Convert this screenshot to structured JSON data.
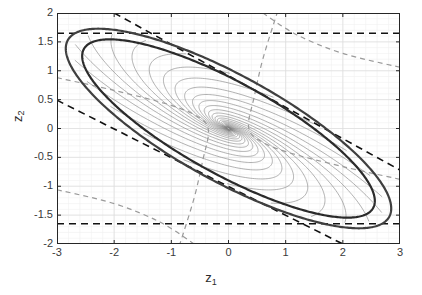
{
  "figure": {
    "background": "#ffffff",
    "axis_color": "#262626",
    "grid_color": "#e6e6e6"
  },
  "axes": {
    "xlabel": "z",
    "xlabel_sub": "1",
    "ylabel": "z",
    "ylabel_sub": "2"
  },
  "chart_data": {
    "type": "line",
    "title": "",
    "xlabel": "z_1",
    "ylabel": "z_2",
    "xlim": [
      -3,
      3
    ],
    "ylim": [
      -2,
      2
    ],
    "xticks": [
      -3,
      -2,
      -1,
      0,
      1,
      2,
      3
    ],
    "yticks": [
      -2,
      -1.5,
      -1,
      -0.5,
      0,
      0.5,
      1,
      1.5,
      2
    ],
    "xticklabels": [
      "-3",
      "-2",
      "-1",
      "0",
      "1",
      "2",
      "3"
    ],
    "yticklabels": [
      "-2",
      "-1.5",
      "-1",
      "-0.5",
      "0",
      "0.5",
      "1",
      "1.5",
      "2"
    ],
    "grid": true,
    "minor_grid": true,
    "legend": null,
    "series": [
      {
        "name": "outer-invariant-ellipse",
        "kind": "ellipse",
        "style": "solid",
        "color": "#3f3f3f",
        "linewidth": 2.2,
        "center": [
          0,
          0
        ],
        "semi_major": 3.2,
        "semi_minor": 0.92,
        "rotation_deg": -28.5
      },
      {
        "name": "inner-invariant-ellipse",
        "kind": "ellipse",
        "style": "solid",
        "color": "#2b2b2b",
        "linewidth": 2.2,
        "center": [
          0,
          0
        ],
        "semi_major": 2.88,
        "semi_minor": 0.8,
        "rotation_deg": -28.5
      },
      {
        "name": "state-trajectories",
        "kind": "spiral-family",
        "style": "solid",
        "color": "#7d7d7d",
        "linewidth": 0.6,
        "count": 22,
        "converges_to": [
          0,
          0
        ],
        "description": "thin gray closed-loop state trajectories spiralling inward to the origin"
      },
      {
        "name": "constraint-line-upper",
        "kind": "horizontal-line",
        "style": "dashed",
        "color": "#111111",
        "linewidth": 1.6,
        "y": 1.65
      },
      {
        "name": "constraint-line-lower",
        "kind": "horizontal-line",
        "style": "dashed",
        "color": "#111111",
        "linewidth": 1.6,
        "y": -1.65
      },
      {
        "name": "constraint-line-diagonal-upper",
        "kind": "segment",
        "style": "dashed",
        "color": "#111111",
        "linewidth": 1.6,
        "points": [
          [
            -2.0,
            2.0
          ],
          [
            3.0,
            -0.72
          ]
        ]
      },
      {
        "name": "constraint-line-diagonal-lower",
        "kind": "segment",
        "style": "dashed",
        "color": "#111111",
        "linewidth": 1.6,
        "points": [
          [
            -3.0,
            0.49
          ],
          [
            2.0,
            -2.0
          ]
        ]
      },
      {
        "name": "gray-dashed-hyperbola-upper",
        "kind": "curve",
        "style": "dashed",
        "color": "#9a9a9a",
        "linewidth": 1.2,
        "points": [
          [
            -3.0,
            0.88
          ],
          [
            -2.0,
            0.66
          ],
          [
            -1.0,
            0.4
          ],
          [
            -0.5,
            0.18
          ],
          [
            -0.35,
            -0.05
          ],
          [
            -0.45,
            -0.55
          ],
          [
            -0.6,
            -1.2
          ],
          [
            -0.85,
            -2.0
          ]
        ]
      },
      {
        "name": "gray-dashed-hyperbola-lower",
        "kind": "curve",
        "style": "dashed",
        "color": "#9a9a9a",
        "linewidth": 1.2,
        "points": [
          [
            3.0,
            -0.88
          ],
          [
            2.0,
            -0.66
          ],
          [
            1.0,
            -0.4
          ],
          [
            0.5,
            -0.18
          ],
          [
            0.35,
            0.05
          ],
          [
            0.45,
            0.55
          ],
          [
            0.6,
            1.2
          ],
          [
            0.85,
            2.0
          ]
        ]
      },
      {
        "name": "gray-dashed-branch-right",
        "kind": "curve",
        "style": "dashed",
        "color": "#9a9a9a",
        "linewidth": 1.2,
        "points": [
          [
            0.6,
            2.0
          ],
          [
            1.2,
            1.62
          ],
          [
            2.0,
            1.3
          ],
          [
            3.0,
            1.06
          ]
        ]
      },
      {
        "name": "gray-dashed-branch-left",
        "kind": "curve",
        "style": "dashed",
        "color": "#9a9a9a",
        "linewidth": 1.2,
        "points": [
          [
            -0.6,
            -2.0
          ],
          [
            -1.2,
            -1.62
          ],
          [
            -2.0,
            -1.3
          ],
          [
            -3.0,
            -1.06
          ]
        ]
      }
    ]
  }
}
